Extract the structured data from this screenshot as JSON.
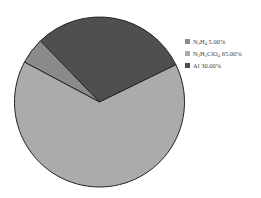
{
  "chart_data": {
    "type": "pie",
    "title": "",
    "legend_position": "right",
    "start_angle_deg": 26,
    "direction": "counterclockwise",
    "slices": [
      {
        "label": "Al",
        "label_display": "Al 30.00%",
        "value": 30.0,
        "color": "#4f4f4f"
      },
      {
        "label": "N2H4",
        "label_display": "N2H4 5.00%",
        "value": 5.0,
        "color": "#8a8a8a"
      },
      {
        "label": "N2H5ClO4",
        "label_display": "N2H5ClO4 65.00%",
        "value": 65.0,
        "color": "#ababab"
      }
    ]
  },
  "legend": {
    "items": [
      {
        "parts": [
          [
            "N",
            ""
          ],
          [
            "2",
            "sub"
          ],
          [
            "H",
            ""
          ],
          [
            "4",
            "sub"
          ],
          [
            " 5.00%",
            ""
          ]
        ],
        "color": "#8a8a8a"
      },
      {
        "parts": [
          [
            "N",
            ""
          ],
          [
            "2",
            "sub"
          ],
          [
            "H",
            ""
          ],
          [
            "5",
            "sub"
          ],
          [
            "ClO",
            ""
          ],
          [
            "4",
            "sub"
          ],
          [
            " 65.00%",
            ""
          ]
        ],
        "color": "#ababab"
      },
      {
        "parts": [
          [
            "Al 30.00%",
            ""
          ]
        ],
        "color": "#4f4f4f"
      }
    ]
  }
}
